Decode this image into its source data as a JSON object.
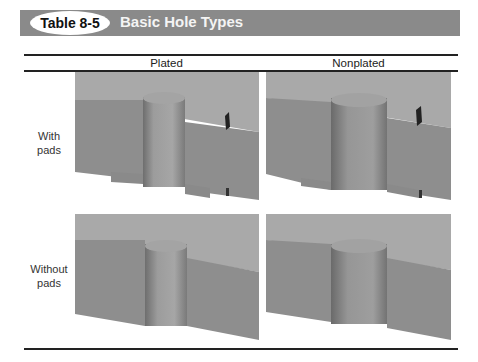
{
  "header": {
    "table_number": "Table 8-5",
    "title": "Basic Hole Types",
    "bar_color": "#8a8a8a"
  },
  "table": {
    "columns": [
      "Plated",
      "Nonplated"
    ],
    "rows": [
      {
        "label_line1": "With",
        "label_line2": "pads",
        "cells": [
          "plated-hole-with-pads illustration",
          "nonplated-hole-with-pads illustration"
        ]
      },
      {
        "label_line1": "Without",
        "label_line2": "pads",
        "cells": [
          "plated-hole-without-pads illustration",
          "nonplated-hole-without-pads illustration"
        ]
      }
    ]
  }
}
